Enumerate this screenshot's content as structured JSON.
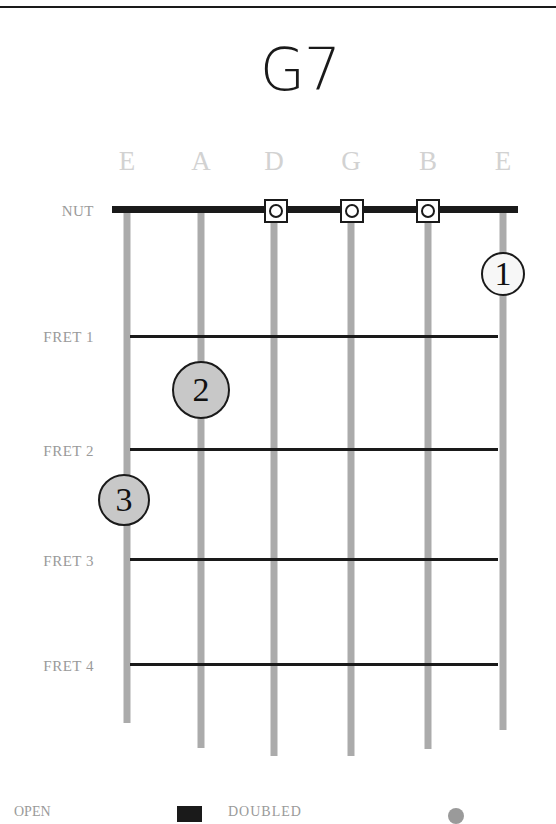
{
  "chord": {
    "title": "G7"
  },
  "strings": [
    {
      "name": "E",
      "x": 127,
      "end_y": 723
    },
    {
      "name": "A",
      "x": 201,
      "end_y": 748
    },
    {
      "name": "D",
      "x": 274,
      "end_y": 756
    },
    {
      "name": "G",
      "x": 351,
      "end_y": 756
    },
    {
      "name": "B",
      "x": 428,
      "end_y": 749
    },
    {
      "name": "E",
      "x": 503,
      "end_y": 730
    }
  ],
  "nut_label": "NUT",
  "frets": [
    {
      "label": "FRET 1",
      "y": 336
    },
    {
      "label": "FRET 2",
      "y": 449
    },
    {
      "label": "FRET 3",
      "y": 559
    },
    {
      "label": "FRET 4",
      "y": 664
    }
  ],
  "open_strings": [
    "D",
    "G",
    "B"
  ],
  "fingers": [
    {
      "number": "1",
      "string": "E (high)",
      "position": "between nut and fret 1",
      "style": "white"
    },
    {
      "number": "2",
      "string": "A",
      "position": "between fret 1 and fret 2",
      "style": "gray"
    },
    {
      "number": "3",
      "string": "E (low)",
      "position": "between fret 2 and fret 3",
      "style": "gray"
    }
  ],
  "legend": {
    "open_label": "OPEN",
    "doubled_label": "DOUBLED"
  },
  "colors": {
    "string": "#ababab",
    "fret": "#1a1a1a",
    "label": "#9a9a9a",
    "string_name": "#d2d2d2",
    "finger_gray": "#c8c8c8",
    "finger_white": "#f7f7f7"
  }
}
